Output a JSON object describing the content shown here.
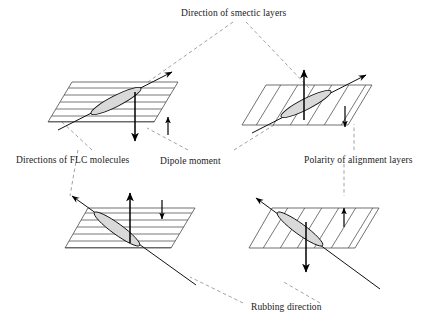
{
  "figure": {
    "background_color": "#ffffff",
    "width": 438,
    "height": 329,
    "line_color": "#111111",
    "plane_stroke_color": "#4d4d4d",
    "leader_color": "#8a8a8a",
    "molecule_fill_color": "#d9d9d9"
  },
  "labels": [
    {
      "id": "smectic-layers",
      "text": "Direction of smectic layers",
      "x": 181,
      "y": 9
    },
    {
      "id": "flc-molecules",
      "text": "Directions of FLC molecules",
      "x": 16,
      "y": 156
    },
    {
      "id": "dipole-moment",
      "text": "Dipole moment",
      "x": 160,
      "y": 157
    },
    {
      "id": "polarity-alignment",
      "text": "Polarity of alignment layers",
      "x": 304,
      "y": 156
    },
    {
      "id": "rubbing-direction",
      "text": "Rubbing direction",
      "x": 251,
      "y": 303
    }
  ],
  "panels": [
    {
      "id": "top-left",
      "name": "top-left-panel",
      "smectic_layer_style": "horizontal",
      "smectic_layer_count": 6,
      "director_direction": "lower-left-to-upper-right",
      "dipole_arrow": "down",
      "dipole_arrow_length": "long",
      "polarity_arrow": "up",
      "polarity_arrow_length": "short"
    },
    {
      "id": "top-right",
      "name": "top-right-panel",
      "smectic_layer_style": "diagonal",
      "smectic_layer_count": 7,
      "director_direction": "lower-left-to-upper-right",
      "dipole_arrow": "up",
      "dipole_arrow_length": "long",
      "polarity_arrow": "down",
      "polarity_arrow_length": "short"
    },
    {
      "id": "bottom-left",
      "name": "bottom-left-panel",
      "smectic_layer_style": "horizontal",
      "smectic_layer_count": 6,
      "director_direction": "upper-left-to-lower-right",
      "dipole_arrow": "up",
      "dipole_arrow_length": "long",
      "polarity_arrow": "down",
      "polarity_arrow_length": "short"
    },
    {
      "id": "bottom-right",
      "name": "bottom-right-panel",
      "smectic_layer_style": "diagonal",
      "smectic_layer_count": 7,
      "director_direction": "upper-left-to-lower-right",
      "dipole_arrow": "down",
      "dipole_arrow_length": "long",
      "polarity_arrow": "up",
      "polarity_arrow_length": "short"
    }
  ]
}
